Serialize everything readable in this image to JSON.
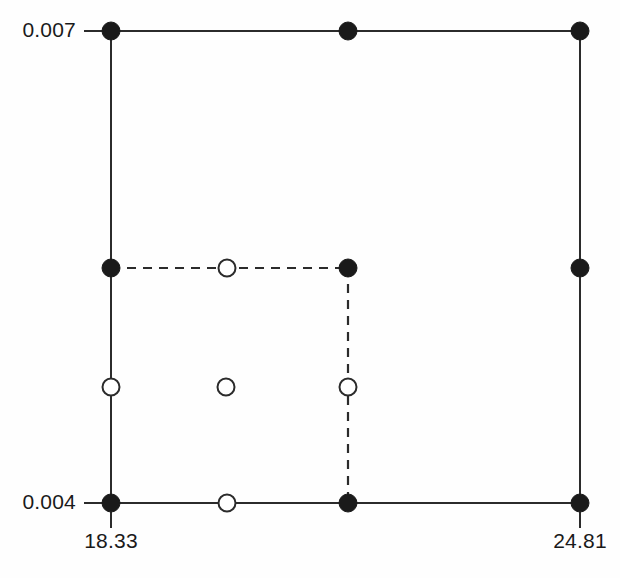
{
  "figure": {
    "title": "",
    "background_color": "#fefefe",
    "line_color": "#2b2b2b",
    "marker_fill_color": "#1a1a1a",
    "marker_open_color": "#ffffff",
    "text_color": "#1a1a1a",
    "width": 620,
    "height": 578
  },
  "axes": {
    "y_ticks": [
      {
        "label": "0.007",
        "value": 0.007,
        "y": 31,
        "label_x": 8,
        "tick_x1": 84,
        "tick_x2": 103
      },
      {
        "label": "0.004",
        "value": 0.004,
        "y": 503,
        "label_x": 8,
        "tick_x1": 84,
        "tick_x2": 103
      }
    ],
    "x_ticks": [
      {
        "label": "18.33",
        "value": 18.33,
        "x": 111,
        "label_y": 529,
        "tick_y1": 512,
        "tick_y2": 528
      },
      {
        "label": "24.81",
        "value": 24.81,
        "x": 580,
        "label_y": 529,
        "tick_y1": 512,
        "tick_y2": 528
      }
    ],
    "x_range": [
      18.33,
      24.81
    ],
    "y_range": [
      0.004,
      0.007
    ]
  },
  "grid_columns": [
    111,
    227,
    348,
    580
  ],
  "grid_rows": [
    31,
    268,
    387,
    503
  ],
  "solid_segments": [
    {
      "name": "top-edge",
      "x1": 111,
      "y1": 31,
      "x2": 580,
      "y2": 31
    },
    {
      "name": "bottom-edge",
      "x1": 111,
      "y1": 503,
      "x2": 580,
      "y2": 503
    },
    {
      "name": "left-edge",
      "x1": 111,
      "y1": 31,
      "x2": 111,
      "y2": 503
    },
    {
      "name": "right-edge",
      "x1": 580,
      "y1": 31,
      "x2": 580,
      "y2": 503
    }
  ],
  "dashed_segments": [
    {
      "name": "inner-horizontal",
      "x1": 111,
      "y1": 268,
      "x2": 348,
      "y2": 268
    },
    {
      "name": "inner-vertical",
      "x1": 348,
      "y1": 268,
      "x2": 348,
      "y2": 503
    }
  ],
  "filled_nodes": [
    {
      "name": "node-top-left",
      "x": 111,
      "y": 31,
      "r": 9
    },
    {
      "name": "node-top-mid",
      "x": 348,
      "y": 31,
      "r": 9
    },
    {
      "name": "node-top-right",
      "x": 580,
      "y": 31,
      "r": 9
    },
    {
      "name": "node-mid-left",
      "x": 111,
      "y": 268,
      "r": 9
    },
    {
      "name": "node-mid-center",
      "x": 348,
      "y": 268,
      "r": 9
    },
    {
      "name": "node-mid-right",
      "x": 580,
      "y": 268,
      "r": 9
    },
    {
      "name": "node-bottom-left",
      "x": 111,
      "y": 503,
      "r": 9
    },
    {
      "name": "node-bottom-mid",
      "x": 348,
      "y": 503,
      "r": 9
    },
    {
      "name": "node-bottom-right",
      "x": 580,
      "y": 503,
      "r": 9
    }
  ],
  "open_nodes": [
    {
      "name": "open-node-upper-center",
      "x": 227,
      "y": 268,
      "r": 8.5
    },
    {
      "name": "open-node-left-middle",
      "x": 111,
      "y": 387,
      "r": 8.5
    },
    {
      "name": "open-node-center-middle",
      "x": 226,
      "y": 387,
      "r": 8.5
    },
    {
      "name": "open-node-right-middle",
      "x": 348,
      "y": 387,
      "r": 8.5
    },
    {
      "name": "open-node-bottom-center",
      "x": 227,
      "y": 503,
      "r": 8.5
    }
  ]
}
